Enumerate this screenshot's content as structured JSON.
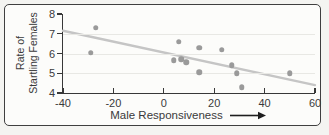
{
  "figure": {
    "bg_outer": "#eff0ec",
    "bg_inner": "#fcfcfa",
    "frame_border": "#3f3f3f"
  },
  "chart_data": {
    "type": "scatter",
    "title": "",
    "xlabel": "Male Responsiveness",
    "ylabel_lines": [
      "Rate of",
      "Startling Females"
    ],
    "xlim": [
      -40,
      60
    ],
    "ylim": [
      4,
      8
    ],
    "x_ticks": [
      "-40",
      "-20",
      "0",
      "20",
      "40",
      "60"
    ],
    "x_tick_values": [
      -40,
      -20,
      0,
      20,
      40,
      60
    ],
    "y_ticks": [
      "8",
      "7",
      "6",
      "5",
      "4"
    ],
    "y_tick_values": [
      8,
      7,
      6,
      5,
      4
    ],
    "gridlines_y": [
      5,
      6,
      7
    ],
    "grid": "horizontal-only",
    "legend": "none",
    "points": [
      {
        "x": -29,
        "y": 6.05
      },
      {
        "x": -27,
        "y": 7.3
      },
      {
        "x": 4,
        "y": 5.65
      },
      {
        "x": 6,
        "y": 6.6
      },
      {
        "x": 7,
        "y": 5.7
      },
      {
        "x": 9,
        "y": 5.55
      },
      {
        "x": 14,
        "y": 6.3
      },
      {
        "x": 14,
        "y": 5.05
      },
      {
        "x": 23,
        "y": 6.2
      },
      {
        "x": 27,
        "y": 5.4
      },
      {
        "x": 29,
        "y": 5.0
      },
      {
        "x": 31,
        "y": 4.3
      },
      {
        "x": 50,
        "y": 5.0
      }
    ],
    "trend": {
      "x1": -40,
      "y1": 7.15,
      "x2": 60,
      "y2": 4.4
    },
    "colors": {
      "point": "#9a9a9a",
      "trend": "#c5c5c5",
      "axis": "#383838",
      "grid": "#e8e8e4",
      "text": "#3a3a3a",
      "arrow": "#1e1e1e"
    }
  }
}
